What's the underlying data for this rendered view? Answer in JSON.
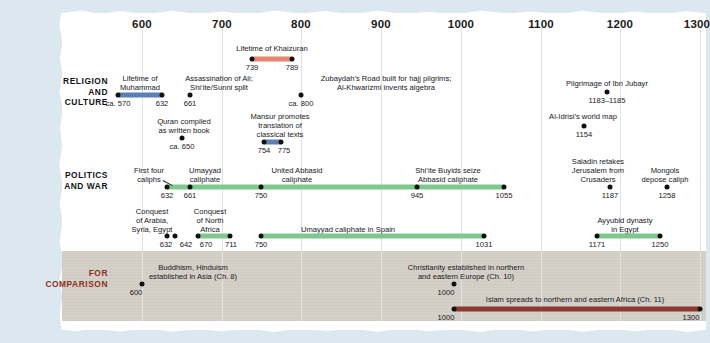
{
  "axis": {
    "ticks": [
      "600",
      "700",
      "800",
      "900",
      "1000",
      "1100",
      "1200",
      "1300"
    ],
    "start_year": 600,
    "end_year": 1300,
    "px_per_century": 79.7,
    "origin_px": 142
  },
  "colors": {
    "page_background": "#dce8ef",
    "sheet": "#ffffff",
    "comparison_band": "#d6d1c8",
    "bar_blue": "#5b7fb4",
    "bar_coral": "#e78671",
    "bar_green": "#7fc78d",
    "bar_darkred": "#8e3a30",
    "dot": "#111111",
    "label_red": "#8b2f24",
    "gridline": "#e2e2e2"
  },
  "rows": [
    {
      "id": "religion",
      "label": "RELIGION\nAND\nCULTURE",
      "label_color": "#121212"
    },
    {
      "id": "politics",
      "label": "POLITICS\nAND WAR",
      "label_color": "#121212"
    },
    {
      "id": "comparison",
      "label": "FOR\nCOMPARISON",
      "label_color": "#8b2f24"
    }
  ],
  "row_labels": {
    "religion_line1": "RELIGION",
    "religion_line2": "AND",
    "religion_line3": "CULTURE",
    "politics_line1": "POLITICS",
    "politics_line2": "AND WAR",
    "comparison_line1": "FOR",
    "comparison_line2": "COMPARISON"
  },
  "events": {
    "khaizuran": {
      "title": "Lifetime of Khaizuran",
      "start_label": "739",
      "end_label": "789",
      "start": 739,
      "end": 789,
      "type": "span",
      "color": "coral",
      "row": "religion"
    },
    "muhammad": {
      "title_line1": "Lifetime of",
      "title_line2": "Muhammad",
      "start_label": "ca. 570",
      "end_label": "632",
      "start": 570,
      "end": 632,
      "type": "span",
      "color": "blue",
      "row": "religion"
    },
    "ali_split": {
      "title_line1": "Assassination of Ali;",
      "title_line2": "Shi‘ite/Sunni split",
      "year_label": "661",
      "year": 661,
      "type": "point",
      "row": "religion"
    },
    "zubaydah": {
      "title_line1": "Zubaydah’s Road built for hajj pilgrims;",
      "title_line2": "Al-Khwarizmi invents algebra",
      "year_label": "ca. 800",
      "year": 800,
      "type": "point",
      "row": "religion"
    },
    "pilgrimage_ibn_jubayr": {
      "title": "Pilgrimage of Ibn Jubayr",
      "year_label": "1183–1185",
      "year": 1184,
      "type": "point",
      "row": "religion"
    },
    "quran": {
      "title_line1": "Quran compiled",
      "title_line2": "as written book",
      "year_label": "ca. 650",
      "year": 650,
      "type": "point",
      "row": "religion"
    },
    "mansur": {
      "title_line1": "Mansur promotes",
      "title_line2": "translation of",
      "title_line3": "classical texts",
      "start_label": "754",
      "end_label": "775",
      "start": 754,
      "end": 775,
      "type": "span",
      "color": "blue",
      "row": "religion"
    },
    "al_idrisi": {
      "title": "Al-Idrisi’s world map",
      "year_label": "1154",
      "year": 1154,
      "type": "point",
      "row": "religion"
    },
    "first_four_caliphs": {
      "title_line1": "First four",
      "title_line2": "caliphs",
      "year_label": "632",
      "year": 632,
      "type": "point",
      "row": "politics"
    },
    "umayyad_caliphate": {
      "title_line1": "Umayyad",
      "title_line2": "caliphate",
      "year_label": "661",
      "year": 661,
      "type": "point",
      "row": "politics"
    },
    "united_abbasid": {
      "title_line1": "United Abbasid",
      "title_line2": "caliphate",
      "year_label": "750",
      "year": 750,
      "type": "point",
      "row": "politics"
    },
    "buyids": {
      "title_line1": "Shi‘ite Buyids seize",
      "title_line2": "Abbasid caliphate",
      "start_label": "945",
      "end_label": "1055",
      "start": 945,
      "end": 1055,
      "type": "point-pair",
      "row": "politics"
    },
    "caliphate_span": {
      "start": 632,
      "end": 1055,
      "type": "span",
      "color": "green",
      "row": "politics"
    },
    "saladin": {
      "title_line1": "Saladin retakes",
      "title_line2": "Jerusalem from",
      "title_line3": "Crusaders",
      "year_label": "1187",
      "year": 1187,
      "type": "point",
      "row": "politics"
    },
    "mongols": {
      "title_line1": "Mongols",
      "title_line2": "depose caliph",
      "year_label": "1258",
      "year": 1258,
      "type": "point",
      "row": "politics"
    },
    "conquest_arabia": {
      "title_line1": "Conquest",
      "title_line2": "of Arabia,",
      "title_line3": "Syria, Egypt",
      "start_label": "632",
      "end_label": "642",
      "start": 632,
      "end": 642,
      "type": "point-pair",
      "row": "politics"
    },
    "conquest_north_africa": {
      "title_line1": "Conquest",
      "title_line2": "of North",
      "title_line3": "Africa",
      "start_label": "670",
      "end_label": "711",
      "start": 670,
      "end": 711,
      "type": "point-pair",
      "row": "politics"
    },
    "umayyad_spain": {
      "title": "Umayyad caliphate in Spain",
      "start_label": "750",
      "end_label": "1031",
      "start": 750,
      "end": 1031,
      "type": "span",
      "color": "green",
      "row": "politics"
    },
    "ayyubid": {
      "title_line1": "Ayyubid dynasty",
      "title_line2": "in Egypt",
      "start_label": "1171",
      "end_label": "1250",
      "start": 1171,
      "end": 1250,
      "type": "span",
      "color": "green",
      "row": "politics"
    },
    "buddhism_hinduism": {
      "title_line1": "Buddhism, Hinduism",
      "title_line2": "established in Asia (Ch. 8)",
      "year_label": "600",
      "year": 600,
      "type": "point",
      "row": "comparison"
    },
    "christianity": {
      "title_line1": "Christianity established in northern",
      "title_line2": "and eastern Europe (Ch. 10)",
      "year_label": "1000",
      "year": 1000,
      "type": "point",
      "row": "comparison"
    },
    "islam_africa": {
      "title": "Islam spreads to northern and eastern Africa (Ch. 11)",
      "start_label": "1000",
      "end_label": "1300",
      "start": 1000,
      "end": 1300,
      "type": "span",
      "color": "darkred",
      "row": "comparison"
    }
  }
}
